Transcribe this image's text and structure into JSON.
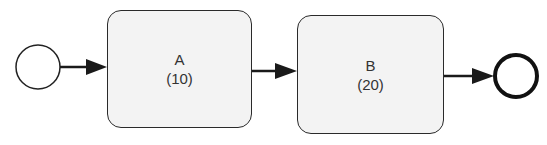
{
  "diagram": {
    "type": "bpmn-process",
    "start_event": {
      "label": ""
    },
    "tasks": [
      {
        "name": "A",
        "duration": "(10)"
      },
      {
        "name": "B",
        "duration": "(20)"
      }
    ],
    "end_event": {
      "label": ""
    },
    "flows": [
      {
        "from": "start",
        "to": "A"
      },
      {
        "from": "A",
        "to": "B"
      },
      {
        "from": "B",
        "to": "end"
      }
    ],
    "colors": {
      "stroke": "#1a1a1a",
      "task_fill": "#f3f3f3",
      "text": "#333333"
    }
  }
}
